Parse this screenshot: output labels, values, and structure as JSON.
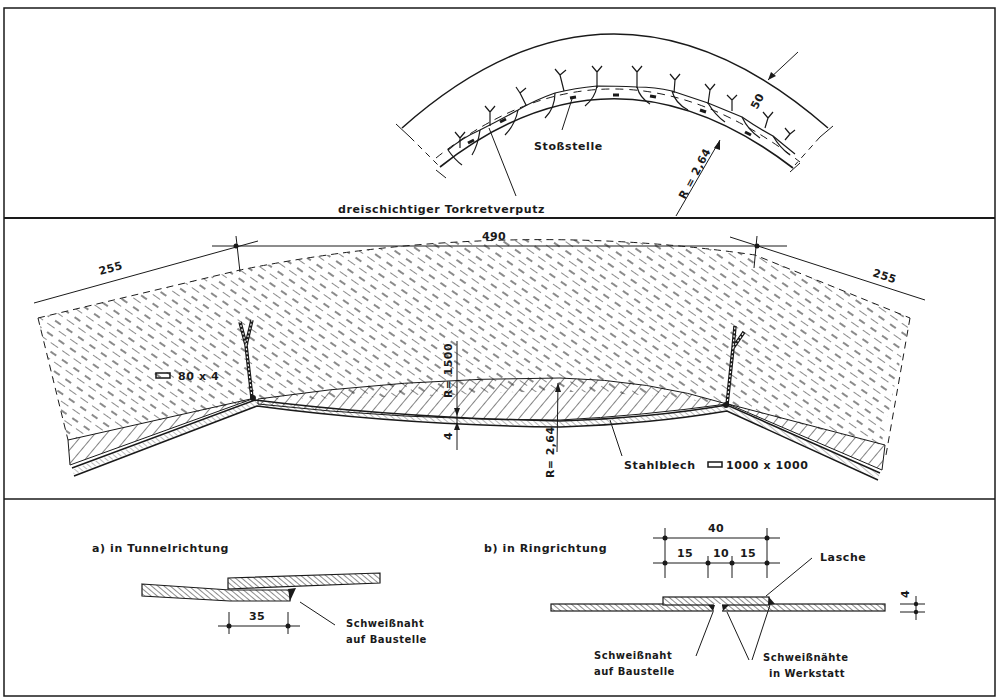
{
  "figure": {
    "panels": [
      {
        "id": "arch-overview",
        "labels": {
          "joint": "Stoßstelle",
          "shotcrete": "dreischichtiger Torkretverputz",
          "thickness": "50",
          "radius": "R = 2,64"
        }
      },
      {
        "id": "segment-section",
        "labels": {
          "dim_left": "255",
          "dim_center": "490",
          "dim_right": "255",
          "flat_bar": "80 x 4",
          "radius_small": "R= 1500",
          "sheet_thickness": "4",
          "radius_large": "R= 2,64",
          "steel_sheet": "Stahlblech",
          "steel_sheet_size": "1000 x 1000"
        }
      },
      {
        "id": "weld-details",
        "detail_a": {
          "title": "a)  in Tunnelrichtung",
          "overlap": "35",
          "weld_line1": "Schweißnaht",
          "weld_line2": "auf Baustelle"
        },
        "detail_b": {
          "title": "b)  in Ringrichtung",
          "total": "40",
          "seg1": "15",
          "seg2": "10",
          "seg3": "15",
          "strap": "Lasche",
          "thickness": "4",
          "site_weld_line1": "Schweißnaht",
          "site_weld_line2": "auf Baustelle",
          "shop_weld_line1": "Schweißnähte",
          "shop_weld_line2": "in Werkstatt"
        }
      }
    ]
  }
}
